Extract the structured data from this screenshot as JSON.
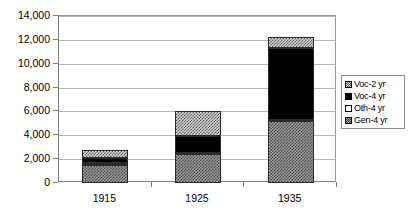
{
  "chart_data": {
    "type": "bar",
    "title": "",
    "subtitle": "",
    "xlabel": "",
    "ylabel": "",
    "stacked": true,
    "grid": true,
    "legend_position": "right",
    "categories": [
      "1915",
      "1925",
      "1935"
    ],
    "ylim": [
      0,
      14000
    ],
    "ytick_values": [
      0,
      2000,
      4000,
      6000,
      8000,
      10000,
      12000,
      14000
    ],
    "ytick_labels": [
      "0",
      "2,000",
      "4,000",
      "6,000",
      "8,000",
      "10,000",
      "12,000",
      "14,000"
    ],
    "series": [
      {
        "name": "Voc-2 yr",
        "pattern": "checker-light",
        "values": [
          700,
          2100,
          900
        ]
      },
      {
        "name": "Voc-4 yr",
        "pattern": "solid-black",
        "values": [
          400,
          1380,
          6000
        ]
      },
      {
        "name": "Oth-4 yr",
        "pattern": "white",
        "values": [
          130,
          120,
          120
        ]
      },
      {
        "name": "Gen-4 yr",
        "pattern": "checker-dark",
        "values": [
          1550,
          2400,
          5200
        ]
      }
    ],
    "stack_order_bottom_to_top": [
      "Gen-4 yr",
      "Oth-4 yr",
      "Voc-4 yr",
      "Voc-2 yr"
    ],
    "totals": [
      2780,
      6000,
      12220
    ],
    "colors": {
      "grid": "#b8b8b8",
      "axis": "#808080",
      "outline": "#2b2b2b",
      "voc4_fill": "#000000",
      "oth4_fill": "#ffffff",
      "background": "#ffffff"
    }
  },
  "legend": {
    "items": [
      {
        "label": "Voc-2 yr",
        "swatch": "checker-light-swatch"
      },
      {
        "label": "Voc-4 yr",
        "swatch": "solid-black-swatch"
      },
      {
        "label": "Oth-4 yr",
        "swatch": "white-swatch"
      },
      {
        "label": "Gen-4 yr",
        "swatch": "checker-dark-swatch"
      }
    ]
  }
}
